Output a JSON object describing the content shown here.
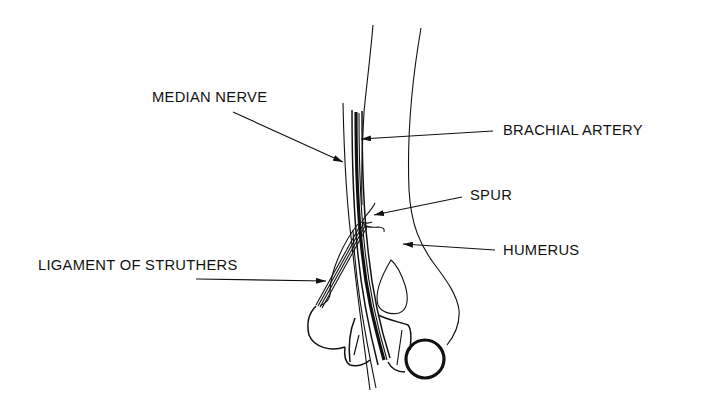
{
  "diagram": {
    "type": "anatomical-line-drawing",
    "ink_color": "#111111",
    "background_color": "#ffffff"
  },
  "labels": {
    "median_nerve": "MEDIAN NERVE",
    "brachial_artery": "BRACHIAL ARTERY",
    "spur": "SPUR",
    "humerus": "HUMERUS",
    "ligament_of_struthers": "LIGAMENT OF STRUTHERS"
  },
  "callouts": [
    {
      "label": "MEDIAN NERVE",
      "side": "left",
      "points_to": "median nerve (thin vertical line left of vessels)"
    },
    {
      "label": "BRACHIAL ARTERY",
      "side": "right",
      "points_to": "dark vessel bundle"
    },
    {
      "label": "SPUR",
      "side": "right",
      "points_to": "supracondylar bony spur"
    },
    {
      "label": "HUMERUS",
      "side": "right",
      "points_to": "humerus shaft"
    },
    {
      "label": "LIGAMENT OF STRUTHERS",
      "side": "left",
      "points_to": "fibrous band from spur to medial epicondyle"
    }
  ]
}
